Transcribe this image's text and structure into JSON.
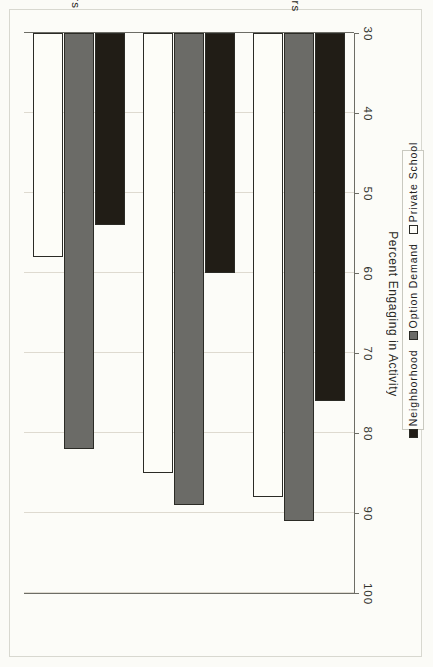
{
  "chart_data": {
    "type": "bar",
    "orientation": "horizontal",
    "title": "",
    "xlabel": "Percent Engaging in Activity",
    "ylabel": "",
    "categories": [
      "PTA Members",
      "Volunteers",
      "Trust Teachers"
    ],
    "series": [
      {
        "name": "Neighborhood",
        "color": "#211d16",
        "values": [
          54,
          60,
          76
        ]
      },
      {
        "name": "Option Demand",
        "color": "#6b6b67",
        "values": [
          82,
          89,
          91
        ]
      },
      {
        "name": "Private School",
        "color": "#fdfdf8",
        "values": [
          58,
          85,
          88
        ]
      }
    ],
    "xlim": [
      30,
      100
    ],
    "xticks": [
      100,
      90,
      80,
      70,
      60,
      50,
      40,
      30
    ],
    "xtick_labels": [
      "100",
      "90",
      "80",
      "70",
      "60",
      "50",
      "40",
      "30"
    ],
    "grid": true,
    "grid_axis": "x",
    "legend_position": "right",
    "page_rotation_degrees": 90
  },
  "axis": {
    "value_axis_title": "Percent Engaging in Activity",
    "tick_labels": [
      "100",
      "90",
      "80",
      "70",
      "60",
      "50",
      "40",
      "30"
    ]
  },
  "legend": {
    "entries": [
      {
        "label": "Neighborhood",
        "swatch": "black-square-swatch"
      },
      {
        "label": "Option Demand",
        "swatch": "gray-square-swatch"
      },
      {
        "label": "Private School",
        "swatch": "white-square-swatch"
      }
    ]
  },
  "categories": [
    {
      "label": "PTA Members"
    },
    {
      "label": "Volunteers"
    },
    {
      "label": "Trust Teachers"
    }
  ]
}
